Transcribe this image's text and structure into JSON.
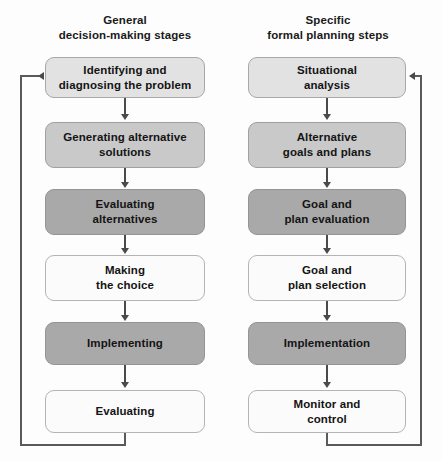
{
  "diagram": {
    "columns": [
      {
        "id": "general",
        "header_line1": "General",
        "header_line2": "decision-making stages",
        "steps": [
          {
            "line1": "Identifying and",
            "line2": "diagnosing the problem",
            "shade": "pale"
          },
          {
            "line1": "Generating alternative",
            "line2": "solutions",
            "shade": "mid"
          },
          {
            "line1": "Evaluating",
            "line2": "alternatives",
            "shade": "dark"
          },
          {
            "line1": "Making",
            "line2": "the choice",
            "shade": "light"
          },
          {
            "line1": "Implementing",
            "line2": "",
            "shade": "dark"
          },
          {
            "line1": "Evaluating",
            "line2": "",
            "shade": "light"
          }
        ],
        "feedback_label": "feedback-loop-general"
      },
      {
        "id": "specific",
        "header_line1": "Specific",
        "header_line2": "formal planning steps",
        "steps": [
          {
            "line1": "Situational",
            "line2": "analysis",
            "shade": "pale"
          },
          {
            "line1": "Alternative",
            "line2": "goals and plans",
            "shade": "mid"
          },
          {
            "line1": "Goal and",
            "line2": "plan evaluation",
            "shade": "dark"
          },
          {
            "line1": "Goal and",
            "line2": "plan selection",
            "shade": "light"
          },
          {
            "line1": "Implementation",
            "line2": "",
            "shade": "dark"
          },
          {
            "line1": "Monitor and",
            "line2": "control",
            "shade": "light"
          }
        ],
        "feedback_label": "feedback-loop-specific"
      }
    ],
    "colors": {
      "background": "#fdfdfd",
      "shade_light": "#fbfbfb",
      "shade_pale": "#e2e2e2",
      "shade_mid": "#c9c9c9",
      "shade_dark": "#a9a9a9",
      "connector": "#4a4a4a",
      "text": "#141414"
    }
  }
}
